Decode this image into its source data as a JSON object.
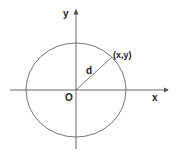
{
  "diagram": {
    "type": "coordinate-circle",
    "axes": {
      "x_label": "x",
      "y_label": "y",
      "origin_label": "O"
    },
    "point": {
      "label": "(x,y)"
    },
    "radius_label": "d",
    "colors": {
      "stroke": "#555555",
      "text": "#222222",
      "background": "#ffffff"
    }
  }
}
